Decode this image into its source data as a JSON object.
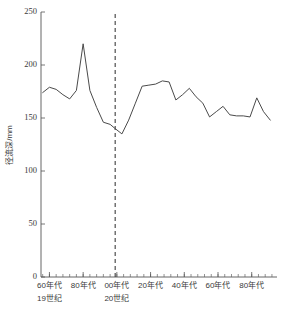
{
  "chart_data": {
    "type": "line",
    "title": "",
    "xlabel": "",
    "ylabel": "径流深/mm",
    "ylim": [
      0,
      250
    ],
    "ytick_labels": [
      "0",
      "50",
      "100",
      "150",
      "200",
      "250"
    ],
    "ytick_values": [
      0,
      50,
      100,
      150,
      200,
      250
    ],
    "xtick_labels": [
      "60年代",
      "80年代",
      "00年代",
      "20年代",
      "40年代",
      "60年代",
      "80年代"
    ],
    "xtick_years": [
      1860,
      1880,
      1900,
      1920,
      1940,
      1960,
      1980
    ],
    "era_labels": [
      {
        "text": "19世纪",
        "year": 1860
      },
      {
        "text": "20世纪",
        "year": 1900
      }
    ],
    "grid": false,
    "legend": "none",
    "xlim": [
      1855,
      1995
    ],
    "annotations": [
      {
        "type": "vline",
        "style": "dashed",
        "year": 1899,
        "label": ""
      }
    ],
    "series": [
      {
        "name": "径流深",
        "color": "#4a4a4a",
        "x": [
          1856,
          1860,
          1864,
          1868,
          1872,
          1876,
          1880,
          1884,
          1888,
          1892,
          1896,
          1899,
          1903,
          1907,
          1911,
          1915,
          1919,
          1923,
          1927,
          1931,
          1935,
          1939,
          1943,
          1947,
          1951,
          1955,
          1959,
          1963,
          1967,
          1971,
          1975,
          1979,
          1983,
          1987,
          1991
        ],
        "values": [
          174,
          179,
          177,
          172,
          168,
          176,
          220,
          176,
          160,
          146,
          144,
          140,
          135,
          148,
          164,
          180,
          181,
          182,
          185,
          184,
          167,
          172,
          178,
          170,
          164,
          151,
          156,
          161,
          153,
          152,
          152,
          151,
          169,
          156,
          148
        ]
      }
    ]
  },
  "axis": {
    "y_unit_caption": "径流深/mm"
  }
}
